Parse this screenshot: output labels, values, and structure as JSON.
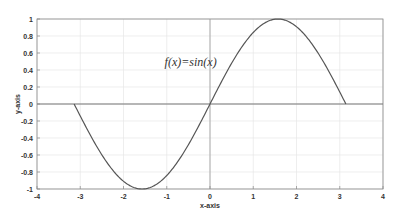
{
  "chart_data": {
    "type": "line",
    "title": "",
    "xlabel": "x-axis",
    "ylabel": "y-axis",
    "xlim": [
      -4,
      4
    ],
    "ylim": [
      -1,
      1
    ],
    "grid": true,
    "legend": null,
    "xticks": [
      -4,
      -3,
      -2,
      -1,
      0,
      1,
      2,
      3,
      4
    ],
    "xtick_labels": [
      "-4",
      "-3",
      "-2",
      "-1",
      "0",
      "1",
      "2",
      "3",
      "4"
    ],
    "yticks": [
      -1,
      -0.8,
      -0.6,
      -0.4,
      -0.2,
      0,
      0.2,
      0.4,
      0.6,
      0.8,
      1
    ],
    "ytick_labels": [
      "-1",
      "-0.8",
      "-0.6",
      "-0.4",
      "-0.2",
      "0",
      "0.2",
      "0.4",
      "0.6",
      "0.8",
      "1"
    ],
    "annotations": [
      {
        "text": "f(x)=sin(x)",
        "x": -1.05,
        "y": 0.5
      }
    ],
    "series": [
      {
        "name": "sin(x)",
        "function": "sin(x)",
        "domain": [
          -3.1416,
          3.1416
        ],
        "color": "#555555",
        "x": [
          -3.1416,
          -2.618,
          -2.0944,
          -1.5708,
          -1.0472,
          -0.5236,
          0,
          0.5236,
          1.0472,
          1.5708,
          2.0944,
          2.618,
          3.1416
        ],
        "y": [
          0,
          -0.5,
          -0.866,
          -1,
          -0.866,
          -0.5,
          0,
          0.5,
          0.866,
          1,
          0.866,
          0.5,
          0
        ]
      }
    ],
    "reference_lines": [
      {
        "orientation": "horizontal",
        "at": 0,
        "from": -4,
        "to": 4,
        "color": "#777777"
      },
      {
        "orientation": "vertical",
        "at": 0,
        "from": -1,
        "to": 1,
        "color": "#999999"
      }
    ]
  },
  "colors": {
    "curve": "#555555",
    "axes_box": "#888888",
    "grid": "#e6e6e6",
    "zero_line_h": "#777777",
    "zero_line_v": "#999999",
    "text": "#333333"
  }
}
